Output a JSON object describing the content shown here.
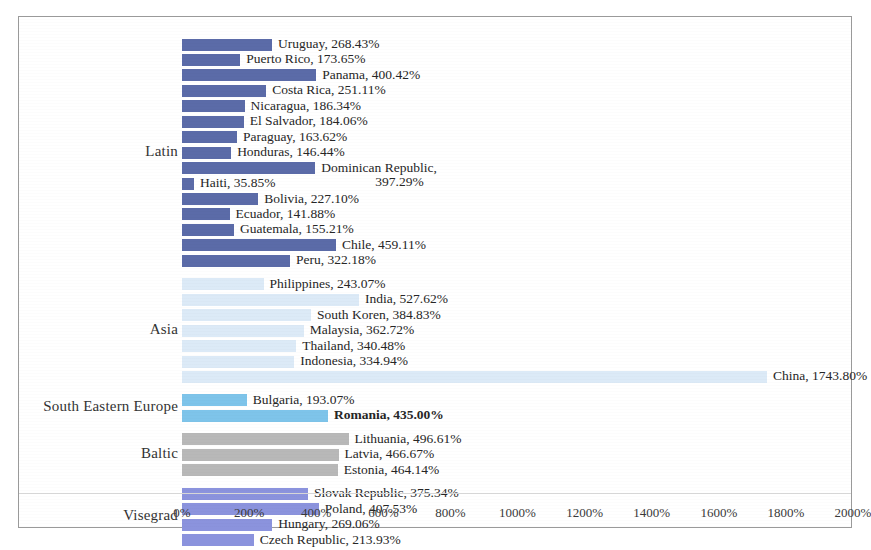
{
  "chart_data": {
    "type": "bar",
    "orientation": "horizontal",
    "title": "",
    "xlabel": "",
    "ylabel": "",
    "xlim": [
      0,
      2000
    ],
    "xticks": [
      "0%",
      "200%",
      "400%",
      "600%",
      "800%",
      "1000%",
      "1200%",
      "1400%",
      "1600%",
      "1800%",
      "2000%"
    ],
    "xtick_values": [
      0,
      200,
      400,
      600,
      800,
      1000,
      1200,
      1400,
      1600,
      1800,
      2000
    ],
    "grid": false,
    "legend": "none",
    "group_labels": [
      "Latin",
      "Asia",
      "South Eastern Europe",
      "Baltic",
      "Visegrad"
    ],
    "colors": {
      "latin": "#5b6ba8",
      "asia": "#dceaf7",
      "south_eastern_europe": "#7ec4ea",
      "baltic": "#b8b8b8",
      "visegrad": "#8b93dd"
    },
    "groups": [
      {
        "name": "Latin",
        "color_key": "latin",
        "items": [
          {
            "label": "Uruguay, 268.43%",
            "country": "Uruguay",
            "value": 268.43
          },
          {
            "label": "Puerto Rico, 173.65%",
            "country": "Puerto Rico",
            "value": 173.65
          },
          {
            "label": "Panama, 400.42%",
            "country": "Panama",
            "value": 400.42
          },
          {
            "label": "Costa Rica, 251.11%",
            "country": "Costa Rica",
            "value": 251.11
          },
          {
            "label": "Nicaragua, 186.34%",
            "country": "Nicaragua",
            "value": 186.34
          },
          {
            "label": "El Salvador, 184.06%",
            "country": "El Salvador",
            "value": 184.06
          },
          {
            "label": "Paraguay, 163.62%",
            "country": "Paraguay",
            "value": 163.62
          },
          {
            "label": "Honduras, 146.44%",
            "country": "Honduras",
            "value": 146.44
          },
          {
            "label": "Dominican Republic,",
            "label2": "397.29%",
            "country": "Dominican Republic",
            "value": 397.29
          },
          {
            "label": "Haiti, 35.85%",
            "country": "Haiti",
            "value": 35.85
          },
          {
            "label": "Bolivia, 227.10%",
            "country": "Bolivia",
            "value": 227.1
          },
          {
            "label": "Ecuador, 141.88%",
            "country": "Ecuador",
            "value": 141.88
          },
          {
            "label": "Guatemala, 155.21%",
            "country": "Guatemala",
            "value": 155.21
          },
          {
            "label": "Chile, 459.11%",
            "country": "Chile",
            "value": 459.11
          },
          {
            "label": "Peru, 322.18%",
            "country": "Peru",
            "value": 322.18
          }
        ]
      },
      {
        "name": "Asia",
        "color_key": "asia",
        "items": [
          {
            "label": "Philippines, 243.07%",
            "country": "Philippines",
            "value": 243.07
          },
          {
            "label": "India, 527.62%",
            "country": "India",
            "value": 527.62
          },
          {
            "label": "South Koren, 384.83%",
            "country": "South Koren",
            "value": 384.83
          },
          {
            "label": "Malaysia, 362.72%",
            "country": "Malaysia",
            "value": 362.72
          },
          {
            "label": "Thailand, 340.48%",
            "country": "Thailand",
            "value": 340.48
          },
          {
            "label": "Indonesia, 334.94%",
            "country": "Indonesia",
            "value": 334.94
          },
          {
            "label": "China, 1743.80%",
            "country": "China",
            "value": 1743.8
          }
        ]
      },
      {
        "name": "South Eastern Europe",
        "color_key": "see",
        "items": [
          {
            "label": "Bulgaria, 193.07%",
            "country": "Bulgaria",
            "value": 193.07
          },
          {
            "label": "Romania, 435.00%",
            "country": "Romania",
            "value": 435.0,
            "bold": true
          }
        ]
      },
      {
        "name": "Baltic",
        "color_key": "baltic",
        "items": [
          {
            "label": "Lithuania, 496.61%",
            "country": "Lithuania",
            "value": 496.61
          },
          {
            "label": "Latvia, 466.67%",
            "country": "Latvia",
            "value": 466.67
          },
          {
            "label": "Estonia, 464.14%",
            "country": "Estonia",
            "value": 464.14
          }
        ]
      },
      {
        "name": "Visegrad",
        "color_key": "vise",
        "items": [
          {
            "label": "Slovak Republic, 375.34%",
            "country": "Slovak Republic",
            "value": 375.34
          },
          {
            "label": "Poland, 407.53%",
            "country": "Poland",
            "value": 407.53
          },
          {
            "label": "Hungary, 269.06%",
            "country": "Hungary",
            "value": 269.06
          },
          {
            "label": "Czech Republic, 213.93%",
            "country": "Czech Republic",
            "value": 213.93
          }
        ]
      }
    ]
  }
}
